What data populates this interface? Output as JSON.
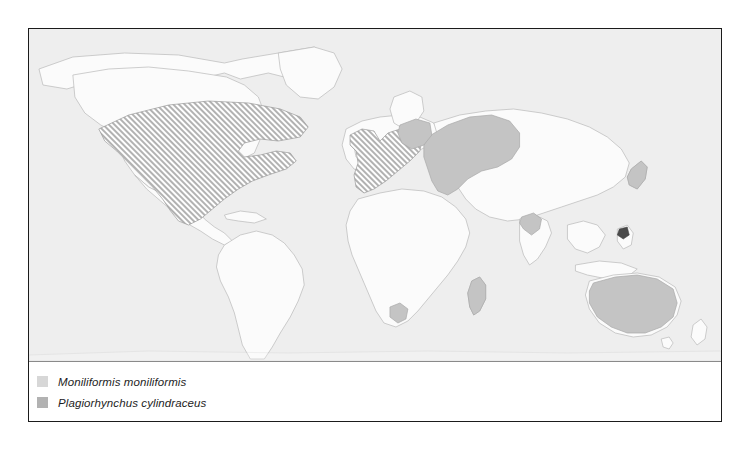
{
  "figure": {
    "title": "",
    "border_color": "#1b1b1b",
    "ocean_color": "#eeeeee",
    "land_fill_color": "#fbfbfb",
    "coastline_color": "#b9b9b9"
  },
  "legend": {
    "items": [
      {
        "swatch_name": "legend-swatch-moniliformis",
        "label": "Moniliformis moniliformis",
        "color": "#d7d7d7",
        "pattern": "hatched"
      },
      {
        "swatch_name": "legend-swatch-plagiorhynchus",
        "label": "Plagiorhynchus cylindraceus",
        "color": "#b2b2b2",
        "pattern": "solid"
      }
    ]
  },
  "map": {
    "projection": "world-equirectangular",
    "distributions": [
      {
        "species": "Moniliformis moniliformis",
        "style": "hatched",
        "regions": [
          "North America",
          "Western Europe",
          "British Isles",
          "Iberian Peninsula",
          "Italy"
        ]
      },
      {
        "species": "Plagiorhynchus cylindraceus",
        "style": "solid",
        "regions": [
          "Western Russia",
          "Eastern Europe",
          "Australia",
          "Japan",
          "Madagascar",
          "South Africa",
          "Pakistan",
          "Taiwan"
        ]
      }
    ]
  }
}
